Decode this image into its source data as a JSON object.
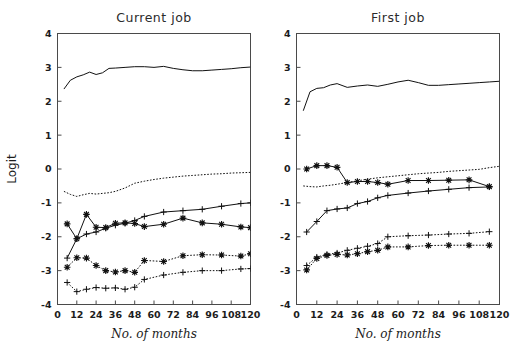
{
  "figure": {
    "width": 519,
    "height": 350,
    "background": "#ffffff",
    "ylabel": "Logit",
    "xlabel_left": "No. of months",
    "xlabel_right": "No. of months"
  },
  "chart_data": [
    {
      "type": "line",
      "title": "Current job",
      "xlabel": "No. of months",
      "ylabel": "Logit",
      "xlim": [
        0,
        120
      ],
      "ylim": [
        -4,
        4
      ],
      "xticks": [
        0,
        12,
        24,
        36,
        48,
        60,
        72,
        84,
        96,
        108,
        120
      ],
      "xticklabels": [
        "0",
        "12",
        "24",
        "36",
        "48",
        "60",
        "72",
        "84",
        "96",
        "108",
        "120"
      ],
      "yticks": [
        -4,
        -3,
        -2,
        -1,
        0,
        1,
        2,
        3,
        4
      ],
      "yticklabels": [
        "-4",
        "-3",
        "-2",
        "-1",
        "0",
        "1",
        "2",
        "3",
        "4"
      ],
      "grid": false,
      "legend": "none",
      "series": [
        {
          "name": "solid-top-no-marker",
          "style": "solid",
          "marker": "none",
          "x": [
            4,
            8,
            12,
            16,
            20,
            24,
            28,
            32,
            36,
            42,
            48,
            54,
            60,
            66,
            72,
            78,
            84,
            90,
            96,
            102,
            108,
            114,
            120
          ],
          "y": [
            2.36,
            2.62,
            2.72,
            2.78,
            2.86,
            2.79,
            2.84,
            2.97,
            2.98,
            3.0,
            3.02,
            3.02,
            3.0,
            3.03,
            2.97,
            2.93,
            2.9,
            2.9,
            2.92,
            2.94,
            2.96,
            2.99,
            3.01
          ]
        },
        {
          "name": "dotted-upper-no-marker",
          "style": "dotted",
          "marker": "none",
          "x": [
            4,
            8,
            12,
            16,
            20,
            24,
            28,
            32,
            36,
            42,
            48,
            54,
            60,
            66,
            72,
            78,
            84,
            90,
            96,
            102,
            108,
            114,
            120
          ],
          "y": [
            -0.66,
            -0.75,
            -0.81,
            -0.76,
            -0.72,
            -0.74,
            -0.72,
            -0.7,
            -0.66,
            -0.56,
            -0.42,
            -0.36,
            -0.31,
            -0.27,
            -0.24,
            -0.21,
            -0.19,
            -0.17,
            -0.15,
            -0.14,
            -0.12,
            -0.11,
            -0.1
          ]
        },
        {
          "name": "solid-plus-marker",
          "style": "solid",
          "marker": "plus",
          "x": [
            6,
            12,
            18,
            24,
            30,
            36,
            42,
            48,
            54,
            66,
            78,
            90,
            102,
            114,
            120
          ],
          "y": [
            -2.63,
            -2.06,
            -1.92,
            -1.86,
            -1.75,
            -1.66,
            -1.6,
            -1.52,
            -1.4,
            -1.27,
            -1.23,
            -1.19,
            -1.1,
            -1.02,
            -1.0
          ]
        },
        {
          "name": "solid-star-marker",
          "style": "solid",
          "marker": "star",
          "x": [
            6,
            12,
            18,
            24,
            30,
            36,
            42,
            48,
            54,
            66,
            78,
            90,
            102,
            114,
            120
          ],
          "y": [
            -1.62,
            -2.06,
            -1.34,
            -1.72,
            -1.73,
            -1.6,
            -1.59,
            -1.61,
            -1.7,
            -1.63,
            -1.45,
            -1.59,
            -1.63,
            -1.71,
            -1.73
          ]
        },
        {
          "name": "dotted-star-marker",
          "style": "dotted",
          "marker": "star",
          "x": [
            6,
            12,
            18,
            24,
            30,
            36,
            42,
            48,
            54,
            66,
            78,
            90,
            102,
            114,
            120
          ],
          "y": [
            -2.9,
            -2.62,
            -2.63,
            -2.85,
            -3.0,
            -3.04,
            -3.0,
            -3.05,
            -2.7,
            -2.73,
            -2.56,
            -2.53,
            -2.54,
            -2.57,
            -2.5
          ]
        },
        {
          "name": "dotted-plus-marker",
          "style": "dotted",
          "marker": "plus",
          "x": [
            6,
            12,
            18,
            24,
            30,
            36,
            42,
            48,
            54,
            66,
            78,
            90,
            102,
            114,
            120
          ],
          "y": [
            -3.35,
            -3.62,
            -3.55,
            -3.5,
            -3.52,
            -3.51,
            -3.55,
            -3.49,
            -3.26,
            -3.13,
            -3.05,
            -3.0,
            -3.0,
            -2.95,
            -2.94
          ]
        }
      ]
    },
    {
      "type": "line",
      "title": "First job",
      "xlabel": "No. of months",
      "ylabel": "Logit",
      "xlim": [
        0,
        120
      ],
      "ylim": [
        -4,
        4
      ],
      "xticks": [
        0,
        12,
        24,
        36,
        48,
        60,
        72,
        84,
        96,
        108,
        120
      ],
      "xticklabels": [
        "0",
        "12",
        "24",
        "36",
        "48",
        "60",
        "72",
        "84",
        "96",
        "108",
        "120"
      ],
      "yticks": [
        -4,
        -3,
        -2,
        -1,
        0,
        1,
        2,
        3,
        4
      ],
      "yticklabels": [
        "-4",
        "-3",
        "-2",
        "-1",
        "0",
        "1",
        "2",
        "3",
        "4"
      ],
      "grid": false,
      "legend": "none",
      "series": [
        {
          "name": "solid-top-no-marker",
          "style": "solid",
          "marker": "none",
          "x": [
            4,
            8,
            12,
            16,
            20,
            24,
            30,
            36,
            42,
            48,
            54,
            60,
            66,
            72,
            78,
            84,
            90,
            96,
            102,
            108,
            114,
            120
          ],
          "y": [
            1.72,
            2.28,
            2.38,
            2.4,
            2.48,
            2.52,
            2.41,
            2.45,
            2.48,
            2.44,
            2.5,
            2.57,
            2.62,
            2.55,
            2.47,
            2.47,
            2.49,
            2.51,
            2.53,
            2.55,
            2.57,
            2.59
          ]
        },
        {
          "name": "dotted-upper-no-marker",
          "style": "dotted",
          "marker": "none",
          "x": [
            4,
            8,
            12,
            16,
            20,
            24,
            30,
            36,
            42,
            48,
            54,
            60,
            66,
            72,
            78,
            84,
            90,
            96,
            102,
            108,
            114,
            120
          ],
          "y": [
            -0.5,
            -0.52,
            -0.53,
            -0.5,
            -0.48,
            -0.45,
            -0.4,
            -0.35,
            -0.3,
            -0.26,
            -0.23,
            -0.2,
            -0.17,
            -0.14,
            -0.12,
            -0.1,
            -0.07,
            -0.05,
            -0.03,
            -0.01,
            0.04,
            0.08
          ]
        },
        {
          "name": "solid-star-marker",
          "style": "solid",
          "marker": "star",
          "x": [
            6,
            12,
            18,
            24,
            30,
            36,
            42,
            48,
            54,
            66,
            78,
            90,
            102,
            114
          ],
          "y": [
            0.0,
            0.1,
            0.1,
            0.05,
            -0.4,
            -0.37,
            -0.37,
            -0.4,
            -0.45,
            -0.34,
            -0.34,
            -0.33,
            -0.32,
            -0.52
          ]
        },
        {
          "name": "solid-plus-marker",
          "style": "solid",
          "marker": "plus",
          "x": [
            6,
            12,
            18,
            24,
            30,
            36,
            42,
            48,
            54,
            66,
            78,
            90,
            102,
            114
          ],
          "y": [
            -1.86,
            -1.55,
            -1.23,
            -1.18,
            -1.15,
            -1.02,
            -0.96,
            -0.85,
            -0.78,
            -0.71,
            -0.65,
            -0.6,
            -0.55,
            -0.53
          ]
        },
        {
          "name": "dotted-plus-marker",
          "style": "dotted",
          "marker": "plus",
          "x": [
            6,
            12,
            18,
            24,
            30,
            36,
            42,
            48,
            54,
            66,
            78,
            90,
            102,
            114
          ],
          "y": [
            -2.85,
            -2.6,
            -2.52,
            -2.48,
            -2.4,
            -2.34,
            -2.28,
            -2.2,
            -2.0,
            -1.97,
            -1.95,
            -1.92,
            -1.9,
            -1.85
          ]
        },
        {
          "name": "dotted-star-marker",
          "style": "dotted",
          "marker": "star",
          "x": [
            6,
            12,
            18,
            24,
            30,
            36,
            42,
            48,
            54,
            66,
            78,
            90,
            102,
            114
          ],
          "y": [
            -2.98,
            -2.64,
            -2.55,
            -2.52,
            -2.54,
            -2.5,
            -2.44,
            -2.4,
            -2.3,
            -2.3,
            -2.26,
            -2.25,
            -2.25,
            -2.25
          ]
        }
      ]
    }
  ]
}
